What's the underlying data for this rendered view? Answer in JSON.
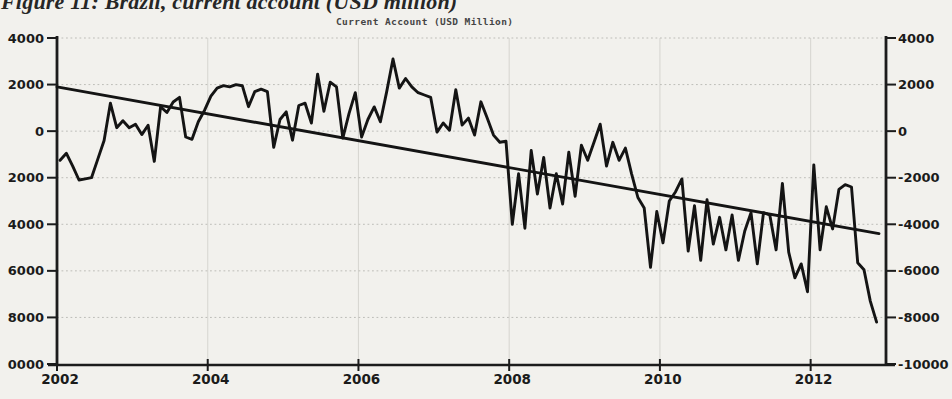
{
  "page": {
    "figure_caption": "Figure 11: Brazil, current account (USD million)",
    "background_color": "#f2f1ed"
  },
  "chart_data": {
    "type": "line",
    "title": "Current Account (USD Million)",
    "x_cadence": "monthly",
    "x_start": "2002-01",
    "x_end": "2012-11",
    "xlim": [
      2002,
      2013
    ],
    "ylim": [
      -10000,
      4000
    ],
    "y_step": 2000,
    "grid": true,
    "legend": "none",
    "line_color": "#141414",
    "trend_color": "#141414",
    "axis_color": "#1c1c1c",
    "grid_color": "#bdbdb8",
    "vgrid_color": "#d8d7d2",
    "x_tick_labels": [
      "2002",
      "2004",
      "2006",
      "2008",
      "2010",
      "2012"
    ],
    "y_axis_left_labels": [
      "4000",
      "2000",
      "0",
      "2000",
      "4000",
      "6000",
      "8000",
      "0000"
    ],
    "y_axis_right_labels": [
      "4000",
      "2000",
      "0",
      "-2000",
      "-4000",
      "-6000",
      "-8000",
      "-10000"
    ],
    "series": [
      {
        "name": "current-account-monthly",
        "values": [
          -1250,
          -950,
          -1500,
          -2100,
          -2050,
          -2000,
          -1200,
          -400,
          1200,
          150,
          450,
          150,
          300,
          -150,
          250,
          -1300,
          1050,
          800,
          1250,
          1450,
          -250,
          -350,
          400,
          900,
          1500,
          1850,
          1950,
          1900,
          2000,
          1950,
          1050,
          1700,
          1800,
          1700,
          -700,
          500,
          830,
          -390,
          1100,
          1200,
          350,
          2450,
          850,
          2100,
          1900,
          -300,
          750,
          1650,
          -250,
          500,
          1040,
          400,
          1700,
          3100,
          1850,
          2260,
          1900,
          1650,
          1550,
          1450,
          -40,
          350,
          40,
          1780,
          260,
          560,
          -170,
          1260,
          560,
          -170,
          -480,
          -430,
          -4000,
          -1830,
          -4170,
          -830,
          -2700,
          -1130,
          -3300,
          -1830,
          -3130,
          -900,
          -2800,
          -610,
          -1250,
          -480,
          300,
          -1500,
          -480,
          -1250,
          -730,
          -1830,
          -2850,
          -3300,
          -5850,
          -3450,
          -4800,
          -3000,
          -2600,
          -2050,
          -5150,
          -3200,
          -5550,
          -2950,
          -4850,
          -3700,
          -5100,
          -3600,
          -5550,
          -4300,
          -3500,
          -5700,
          -3500,
          -3600,
          -5100,
          -2250,
          -5200,
          -6300,
          -5700,
          -6900,
          -1450,
          -5100,
          -3250,
          -4200,
          -2500,
          -2300,
          -2400,
          -5650,
          -5950,
          -7300,
          -8200
        ]
      }
    ],
    "trend_line": {
      "name": "linear-trend",
      "start_value": 1900,
      "end_value": -4400
    }
  }
}
